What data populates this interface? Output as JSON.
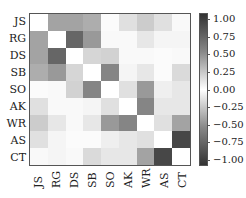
{
  "chart_data": {
    "type": "heatmap",
    "title": "",
    "xlabel": "",
    "ylabel": "",
    "labels": [
      "JS",
      "RG",
      "DS",
      "SB",
      "SO",
      "AK",
      "WR",
      "AS",
      "CT"
    ],
    "matrix": [
      [
        0.0,
        0.45,
        0.45,
        0.4,
        0.02,
        0.15,
        0.25,
        0.15,
        0.03
      ],
      [
        0.45,
        0.0,
        0.75,
        0.5,
        0.03,
        0.03,
        0.12,
        0.05,
        0.05
      ],
      [
        0.45,
        0.75,
        0.0,
        0.2,
        0.22,
        0.03,
        0.03,
        0.02,
        0.03
      ],
      [
        0.4,
        0.5,
        0.2,
        0.0,
        0.6,
        0.05,
        0.12,
        0.02,
        0.18
      ],
      [
        0.02,
        0.03,
        0.22,
        0.6,
        0.0,
        0.15,
        0.5,
        0.08,
        0.12
      ],
      [
        0.15,
        0.03,
        0.03,
        0.05,
        0.15,
        0.0,
        0.6,
        0.12,
        0.12
      ],
      [
        0.25,
        0.12,
        0.03,
        0.12,
        0.5,
        0.6,
        0.0,
        0.15,
        0.45
      ],
      [
        0.15,
        0.05,
        0.02,
        0.02,
        0.08,
        0.12,
        0.15,
        0.0,
        0.9
      ],
      [
        0.03,
        0.05,
        0.03,
        0.18,
        0.12,
        0.12,
        0.45,
        0.9,
        0.0
      ]
    ],
    "colorbar": {
      "range": [
        -1.0,
        1.0
      ],
      "ticks": [
        "1.00",
        "0.75",
        "0.50",
        "0.25",
        "0.00",
        "−0.25",
        "−0.50",
        "−0.75",
        "−1.00"
      ],
      "colormap": "diverging gray (dark at ±1, white at 0)"
    },
    "grid": false,
    "legend_position": "right"
  }
}
